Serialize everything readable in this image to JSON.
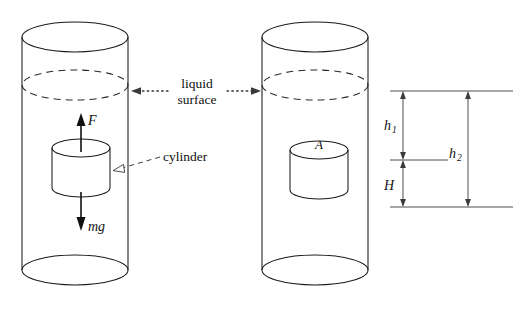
{
  "figure": {
    "background_color": "#ffffff",
    "line_color": "#1a1a1a"
  },
  "labels": {
    "liquid_surface_line1": "liquid",
    "liquid_surface_line2": "surface",
    "cylinder": "cylinder",
    "force_buoyant": "F",
    "force_weight": "mg",
    "area": "A",
    "height_h1_base": "h",
    "height_h1_sub": "1",
    "height_h2_base": "h",
    "height_h2_sub": "2",
    "height_H": "H"
  },
  "geometry": {
    "left_vessel": {
      "left_x": 22,
      "right_x": 128,
      "top_ellipse_cy": 37,
      "bottom_ellipse_cy": 270,
      "ellipse_rx": 53,
      "ellipse_ry": 15,
      "liquid_surface_cy": 85
    },
    "right_vessel": {
      "left_x": 262,
      "right_x": 368,
      "top_ellipse_cy": 37,
      "bottom_ellipse_cy": 270,
      "ellipse_rx": 53,
      "ellipse_ry": 15,
      "liquid_surface_cy": 85
    },
    "left_block": {
      "left_x": 52,
      "right_x": 110,
      "top_cy": 148,
      "bottom_cy": 188,
      "rx": 29,
      "ry": 9
    },
    "right_block": {
      "left_x": 290,
      "right_x": 348,
      "top_cy": 150,
      "bottom_cy": 190,
      "rx": 29,
      "ry": 9
    },
    "dimension_lines": {
      "top_y": 91,
      "mid_y": 160,
      "bottom_y": 207,
      "line_left_x": 390,
      "line_right_x": 513,
      "h1_H_axis_x": 403,
      "h2_axis_x": 468,
      "mid_line_left_x": 390,
      "mid_line_right_x": 448
    }
  }
}
